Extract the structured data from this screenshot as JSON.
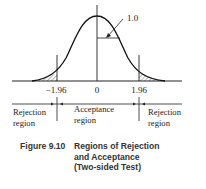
{
  "figure": {
    "ticks": {
      "left": "−1.96",
      "center": "0",
      "right": "1.96"
    },
    "height_label": "1.0",
    "regions": {
      "left": [
        "Rejection",
        "region"
      ],
      "middle": [
        "Acceptance",
        "region"
      ],
      "right": [
        "Rejection",
        "region"
      ]
    },
    "caption": {
      "number": "Figure 9.10",
      "lines": [
        "Regions of Rejection",
        "and Acceptance",
        "(Two-sided Test)"
      ]
    },
    "colors": {
      "ink": "#222222",
      "caption": "#333333",
      "background": "#ffffff"
    }
  }
}
